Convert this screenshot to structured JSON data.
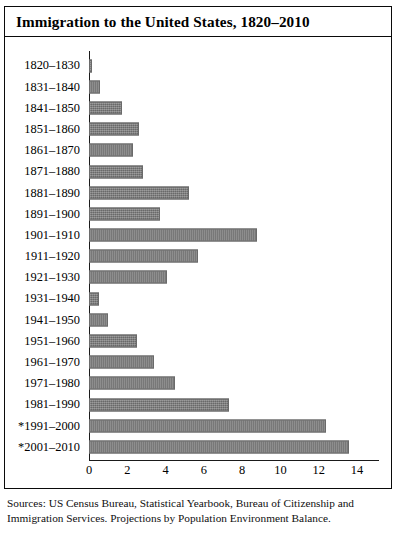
{
  "figure": {
    "title": "Immigration to the United States, 1820–2010",
    "source_note": "Sources: US Census Bureau, Statistical Yearbook, Bureau of Citizenship and Immigration Services. Projections by Population Environment Balance."
  },
  "chart_data": {
    "type": "bar",
    "orientation": "horizontal",
    "title": "Immigration to the United States, 1820–2010",
    "xlabel": "",
    "ylabel": "",
    "xlim": [
      0,
      14
    ],
    "xticks": [
      0,
      2,
      4,
      6,
      8,
      10,
      12,
      14
    ],
    "xtick_labels": [
      "0",
      "2",
      "4",
      "6",
      "8",
      "10",
      "12",
      "14"
    ],
    "grid": false,
    "legend": "none",
    "bar_color": "#777777",
    "categories": [
      "1820–1830",
      "1831–1840",
      "1841–1850",
      "1851–1860",
      "1861–1870",
      "1871–1880",
      "1881–1890",
      "1891–1900",
      "1901–1910",
      "1911–1920",
      "1921–1930",
      "1931–1940",
      "1941–1950",
      "1951–1960",
      "1961–1970",
      "1971–1980",
      "1981–1990",
      "*1991–2000",
      "*2001–2010"
    ],
    "values": [
      0.15,
      0.6,
      1.7,
      2.6,
      2.3,
      2.8,
      5.2,
      3.7,
      8.8,
      5.7,
      4.1,
      0.5,
      1.0,
      2.5,
      3.4,
      4.5,
      7.3,
      12.4,
      13.6
    ],
    "value_unit": "millions"
  }
}
